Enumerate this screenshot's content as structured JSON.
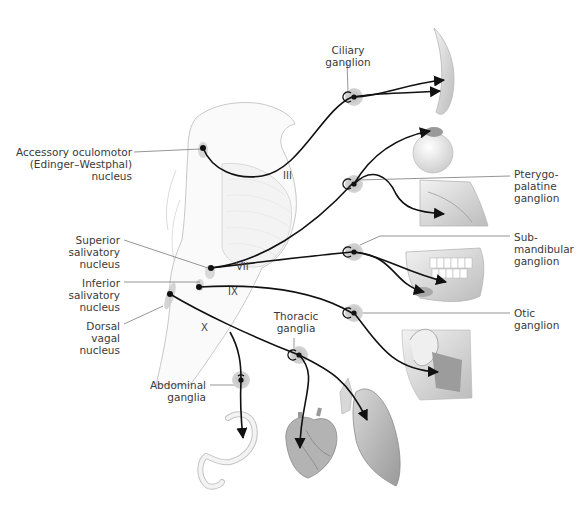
{
  "diagram": {
    "type": "anatomical-pathway",
    "nuclei": [
      {
        "id": "edinger",
        "label": "Accessory oculomotor\n(Edinger–Westphal)\nnucleus",
        "x": 203,
        "y": 148
      },
      {
        "id": "sup_sal",
        "label": "Superior\nsalivatory\nnucleus",
        "x": 211,
        "y": 268
      },
      {
        "id": "inf_sal",
        "label": "Inferior\nsalivatory\nnucleus",
        "x": 199,
        "y": 287
      },
      {
        "id": "dorsal_vagal",
        "label": "Dorsal\nvagal\nnucleus",
        "x": 170,
        "y": 294
      }
    ],
    "nerves": [
      {
        "id": "III",
        "label": "III",
        "x": 287,
        "y": 176
      },
      {
        "id": "VII",
        "label": "VII",
        "x": 240,
        "y": 267
      },
      {
        "id": "IX",
        "label": "IX",
        "x": 228,
        "y": 292
      },
      {
        "id": "X",
        "label": "X",
        "x": 201,
        "y": 327
      }
    ],
    "ganglia": [
      {
        "id": "ciliary",
        "label": "Ciliary\nganglion",
        "x": 352,
        "y": 97
      },
      {
        "id": "pterygo",
        "label": "Pterygo-\npalatine\nganglion",
        "x": 353,
        "y": 184
      },
      {
        "id": "submand",
        "label": "Sub-\nmandibular\nganglion",
        "x": 353,
        "y": 252
      },
      {
        "id": "otic",
        "label": "Otic\nganglion",
        "x": 353,
        "y": 313
      },
      {
        "id": "thoracic",
        "label": "Thoracic\nganglia",
        "x": 299,
        "y": 355
      },
      {
        "id": "abdominal",
        "label": "Abdominal\nganglia",
        "x": 241,
        "y": 380
      }
    ],
    "targets": [
      {
        "id": "lens",
        "label": "ciliary-muscle-lens"
      },
      {
        "id": "eye",
        "label": "lacrimal-gland-eye"
      },
      {
        "id": "nasal",
        "label": "nasal-cavity-glands"
      },
      {
        "id": "jaw",
        "label": "submandibular-sublingual-glands"
      },
      {
        "id": "ear",
        "label": "parotid-gland"
      },
      {
        "id": "stomach",
        "label": "stomach-intestine"
      },
      {
        "id": "heart",
        "label": "heart"
      },
      {
        "id": "lung",
        "label": "lung"
      }
    ],
    "colors": {
      "pathway": "#111111",
      "ganglion_halo": "#c8c8c8",
      "leader": "#7a7a7a",
      "organ": "#d9d9d9",
      "label": "#3a3a3a"
    }
  },
  "labels": {
    "edinger": [
      "Accessory oculomotor",
      "(Edinger–Westphal)",
      "nucleus"
    ],
    "sup_sal": [
      "Superior",
      "salivatory",
      "nucleus"
    ],
    "inf_sal": [
      "Inferior",
      "salivatory",
      "nucleus"
    ],
    "dorsal_vagal": [
      "Dorsal",
      "vagal",
      "nucleus"
    ],
    "ciliary": [
      "Ciliary",
      "ganglion"
    ],
    "pterygo": [
      "Pterygo-",
      "palatine",
      "ganglion"
    ],
    "submand": [
      "Sub-",
      "mandibular",
      "ganglion"
    ],
    "otic": [
      "Otic",
      "ganglion"
    ],
    "thoracic": [
      "Thoracic",
      "ganglia"
    ],
    "abdominal": [
      "Abdominal",
      "ganglia"
    ],
    "nerve_III": "III",
    "nerve_VII": "VII",
    "nerve_IX": "IX",
    "nerve_X": "X"
  }
}
